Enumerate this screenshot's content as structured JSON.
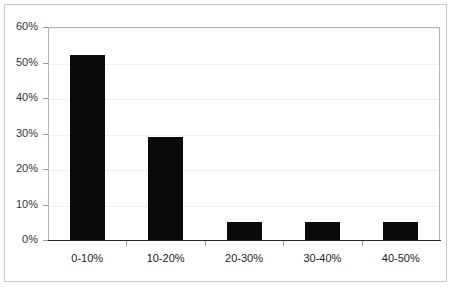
{
  "chart_data": {
    "type": "bar",
    "title": "",
    "subtitle": "",
    "xlabel": "",
    "ylabel": "",
    "categories": [
      "0-10%",
      "10-20%",
      "20-30%",
      "30-40%",
      "40-50%"
    ],
    "values": [
      52,
      29,
      5,
      5,
      5
    ],
    "value_labels": [
      "52%",
      "29%",
      "5%",
      "5%",
      "5%"
    ],
    "ylim": [
      0,
      60
    ],
    "ytick_step": 10,
    "ytick_labels": [
      "0%",
      "10%",
      "20%",
      "30%",
      "40%",
      "50%",
      "60%"
    ],
    "ytick_values": [
      0,
      10,
      20,
      30,
      40,
      50,
      60
    ],
    "grid": true,
    "grid_axis": "y",
    "legend": false,
    "legend_position": "none",
    "series": [
      {
        "name": "",
        "values": [
          52,
          29,
          5,
          5,
          5
        ]
      }
    ],
    "colors": {
      "bar": "#0a0a0a",
      "gridline": "#f0f0f0",
      "axis": "#2b2b2b",
      "plot_border": "#b5b5b5",
      "outer_border": "#c9c9c9",
      "background": "#ffffff",
      "tick_label": "#333333"
    }
  }
}
